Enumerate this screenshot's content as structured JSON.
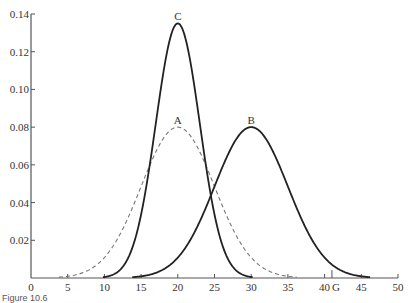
{
  "chart_data": {
    "type": "line",
    "title": "",
    "xlabel": "",
    "ylabel": "",
    "xlim": [
      0,
      50
    ],
    "ylim": [
      0,
      0.14
    ],
    "grid": false,
    "x_ticks": [
      0,
      5,
      10,
      15,
      20,
      25,
      30,
      35,
      40,
      45,
      50
    ],
    "y_ticks": [
      0.02,
      0.04,
      0.06,
      0.08,
      0.1,
      0.12,
      0.14
    ],
    "y_tick_labels": [
      "0.02",
      "0.04",
      "0.06",
      "0.08",
      "0.10",
      "0.12",
      "0.14"
    ],
    "annotations": [
      {
        "text": "G",
        "x": 41,
        "type": "x-axis-marker"
      }
    ],
    "series": [
      {
        "name": "A",
        "style": "dashed",
        "distribution": "normal",
        "mean": 20,
        "sd": 5,
        "peak": 0.08
      },
      {
        "name": "B",
        "style": "solid",
        "distribution": "normal",
        "mean": 30,
        "sd": 5,
        "peak": 0.08
      },
      {
        "name": "C",
        "style": "solid",
        "distribution": "normal",
        "mean": 20,
        "sd": 3,
        "peak": 0.135
      }
    ]
  },
  "caption": "Figure 10.6"
}
